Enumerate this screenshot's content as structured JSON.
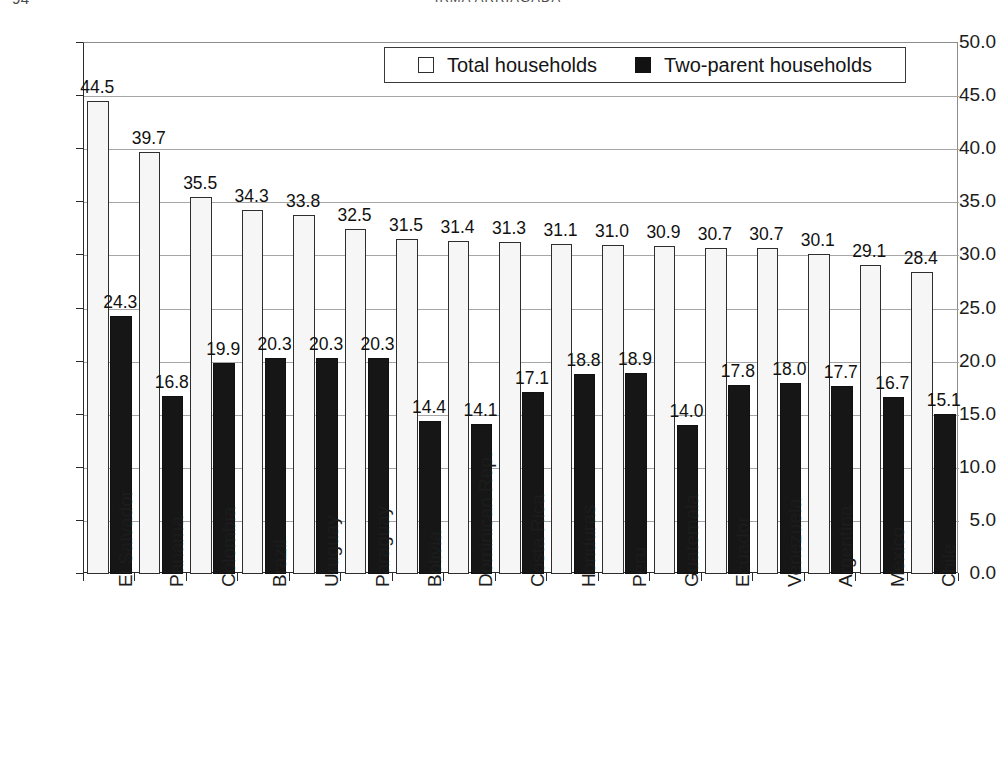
{
  "page": {
    "folio": "94",
    "running_head": "IRMA ARRIAGADA"
  },
  "legend": {
    "position": "top-right-inside",
    "entries": [
      {
        "label": "Total households",
        "swatch": "white-outlined-square",
        "color": "#ffffff"
      },
      {
        "label": "Two-parent households",
        "swatch": "black-filled-square",
        "color": "#121212"
      }
    ]
  },
  "chart_data": {
    "type": "bar",
    "title": "",
    "subtitle": "",
    "xlabel": "",
    "ylabel": "",
    "ylim": [
      0.0,
      50.0
    ],
    "ytick_step": 5.0,
    "ytick_labels": [
      "0.0",
      "5.0",
      "10.0",
      "15.0",
      "20.0",
      "25.0",
      "30.0",
      "35.0",
      "40.0",
      "45.0",
      "50.0"
    ],
    "grid": true,
    "grid_axis": "y",
    "legend_position": "upper right",
    "data_labels": true,
    "categories": [
      "El Salvador",
      "Panama",
      "Colombia",
      "Brazil",
      "Uruguay",
      "Paraguay",
      "Bolivia",
      "Dominican Rep.",
      "Costa Rica",
      "Honduras",
      "Peru",
      "Guatemala",
      "Ecuador",
      "Venezuela",
      "Argentina",
      "Mexico",
      "Chile"
    ],
    "series": [
      {
        "name": "Total households",
        "color": "#f6f6f6",
        "values": [
          44.5,
          39.7,
          35.5,
          34.3,
          33.8,
          32.5,
          31.5,
          31.4,
          31.3,
          31.1,
          31.0,
          30.9,
          30.7,
          30.7,
          30.1,
          29.1,
          28.4
        ]
      },
      {
        "name": "Two-parent households",
        "color": "#161616",
        "values": [
          24.3,
          16.8,
          19.9,
          20.3,
          20.3,
          20.3,
          14.4,
          14.1,
          17.1,
          18.8,
          18.9,
          14.0,
          17.8,
          18.0,
          17.7,
          16.7,
          15.1
        ]
      }
    ]
  }
}
